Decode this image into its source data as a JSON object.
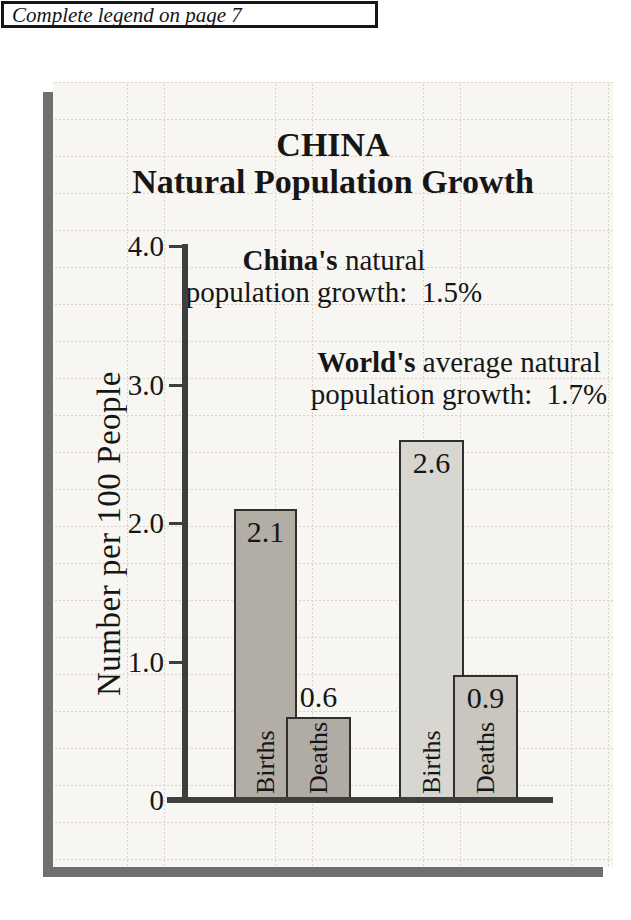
{
  "page": {
    "legend_note": "Complete legend on page 7"
  },
  "chart_data": {
    "type": "bar",
    "title": "CHINA",
    "subtitle": "Natural Population Growth",
    "ylabel": "Number per 100 People",
    "xlabel": "",
    "ylim": [
      0,
      4.0
    ],
    "grid": true,
    "legend_position": "none",
    "yticks": [
      {
        "label": "4.0",
        "value": 4.0
      },
      {
        "label": "3.0",
        "value": 3.0
      },
      {
        "label": "2.0",
        "value": 2.0
      },
      {
        "label": "1.0",
        "value": 1.0
      },
      {
        "label": "0",
        "value": 0
      }
    ],
    "groups": [
      {
        "name": "China",
        "bars": [
          {
            "category": "Births",
            "value": 2.1,
            "color": "#b2aea6",
            "value_label_position": "inside"
          },
          {
            "category": "Deaths",
            "value": 0.6,
            "color": "#b0aca4",
            "value_label_position": "above"
          }
        ]
      },
      {
        "name": "World",
        "bars": [
          {
            "category": "Births",
            "value": 2.6,
            "color": "#d8d6d1",
            "value_label_position": "inside"
          },
          {
            "category": "Deaths",
            "value": 0.9,
            "color": "#c9c6bf",
            "value_label_position": "inside"
          }
        ]
      }
    ],
    "annotations": [
      {
        "bold": "China's",
        "rest": " natural",
        "line2": "population growth:  1.5%"
      },
      {
        "bold": "World's",
        "rest": " average natural",
        "line2": "population growth:  1.7%"
      }
    ]
  },
  "colors": {
    "panel_bg": "#f7f6f2",
    "grid_line": "#d9d3c6",
    "shadow": "#6f6f6f",
    "axis": "#3e3e3e",
    "ink": "#161616"
  }
}
